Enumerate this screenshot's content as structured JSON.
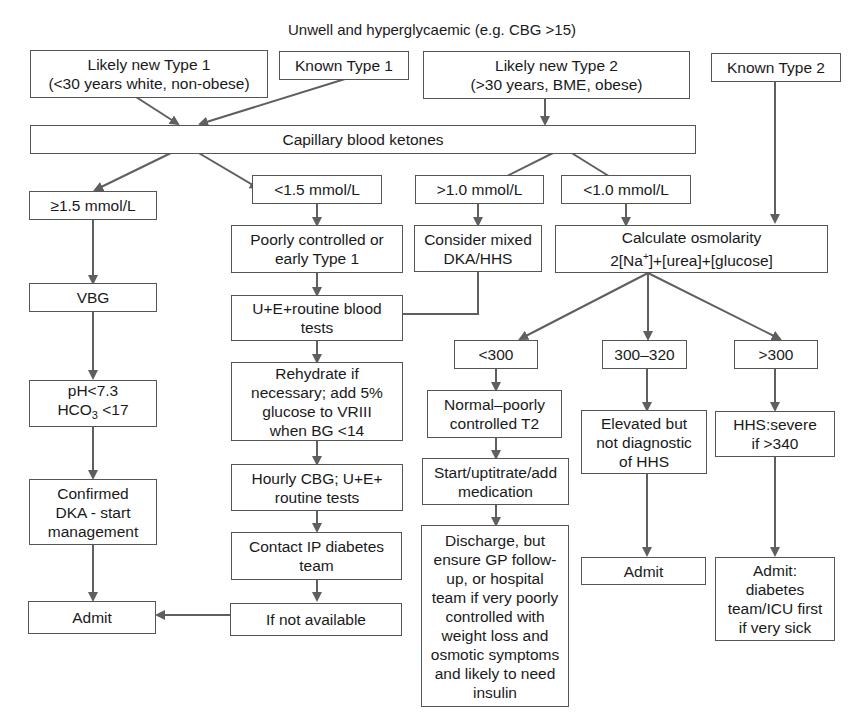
{
  "title": "Unwell and hyperglycaemic (e.g. CBG >15)",
  "nodes": {
    "likely_new_t1": "Likely new Type 1\n(<30 years white, non-obese)",
    "known_t1": "Known Type 1",
    "likely_new_t2": "Likely new Type 2\n(>30 years, BME, obese)",
    "known_t2": "Known Type 2",
    "ketones": "Capillary blood ketones",
    "ket_ge_1_5": "≥1.5 mmol/L",
    "ket_lt_1_5": "<1.5 mmol/L",
    "ket_gt_1_0": ">1.0 mmol/L",
    "ket_lt_1_0": "<1.0 mmol/L",
    "poorly_controlled": "Poorly controlled or\nearly Type 1",
    "mixed": "Consider mixed\nDKA/HHS",
    "osmolarity_title": "Calculate osmolarity",
    "osmolarity_formula_a": "2[Na",
    "osmolarity_formula_sup": "+",
    "osmolarity_formula_b": "]+[urea]+[glucose]",
    "vbg": "VBG",
    "ue_routine": "U+E+routine blood\ntests",
    "ph_line": "pH<7.3",
    "hco3_a": "HCO",
    "hco3_sub": "3",
    "hco3_b": " <17",
    "rehydrate": "Rehydrate if\nnecessary; add 5%\nglucose to VRIII\nwhen BG <14",
    "hourly_cbg": "Hourly CBG; U+E+\nroutine tests",
    "contact_ip": "Contact IP diabetes\nteam",
    "if_not_available": "If not available",
    "confirmed_dka": "Confirmed\nDKA - start\nmanagement",
    "admit_left": "Admit",
    "osm_lt_300": "<300",
    "osm_300_320": "300–320",
    "osm_gt_300": ">300",
    "normal_poorly": "Normal–poorly\ncontrolled T2",
    "start_medication": "Start/uptitrate/add\nmedication",
    "discharge": "Discharge, but\nensure GP follow-\nup, or hospital\nteam if very poorly\ncontrolled with\nweight loss and\nosmotic symptoms\nand likely to need\ninsulin",
    "elevated": "Elevated but\nnot diagnostic\nof HHS",
    "hhs_severe": "HHS:severe\nif >340",
    "admit_mid": "Admit",
    "admit_icu": "Admit:\ndiabetes\nteam/ICU first\nif very sick"
  },
  "colors": {
    "arrow": "#5f5f5f",
    "border": "#555555",
    "text": "#1a1a1a"
  }
}
